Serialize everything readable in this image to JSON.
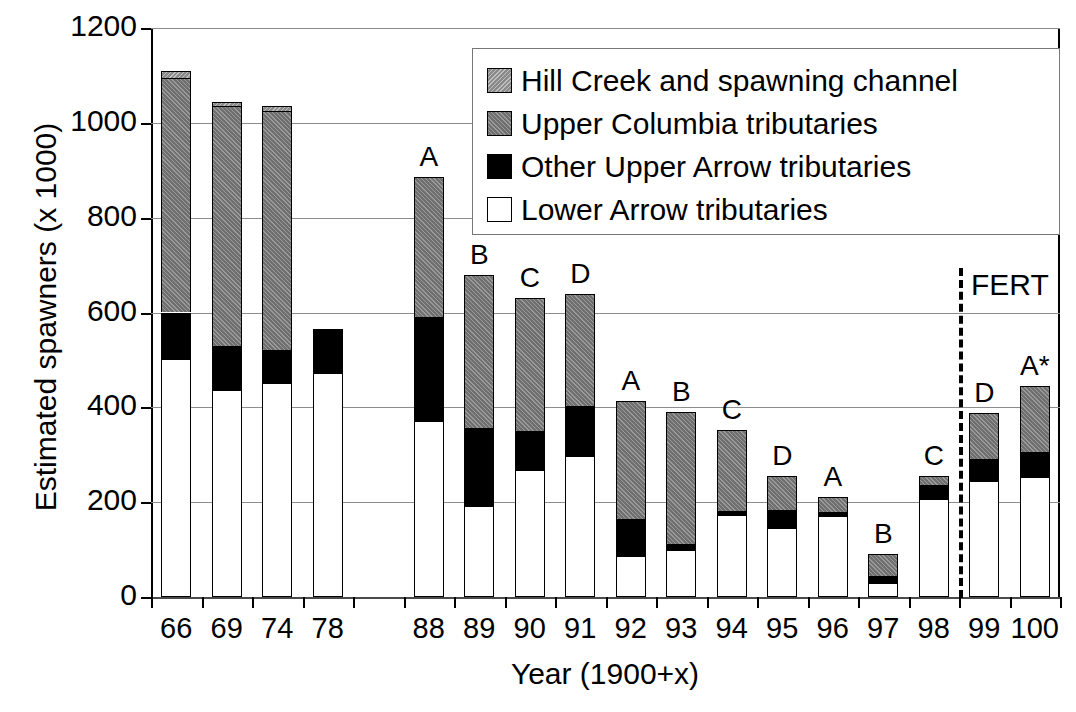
{
  "chart_data": {
    "type": "bar",
    "stacked": true,
    "title": "",
    "xlabel": "Year (1900+x)",
    "ylabel": "Estimated spawners (x 1000)",
    "ylim": [
      0,
      1200
    ],
    "yticks": [
      0,
      200,
      400,
      600,
      800,
      1000,
      1200
    ],
    "grid": true,
    "legend_position": "top-right",
    "categories": [
      "66",
      "69",
      "74",
      "78",
      "",
      "88",
      "89",
      "90",
      "91",
      "92",
      "93",
      "94",
      "95",
      "96",
      "97",
      "98",
      "99",
      "100"
    ],
    "series": [
      {
        "name": "Lower Arrow tributaries",
        "values": [
          500,
          435,
          450,
          470,
          null,
          370,
          190,
          265,
          295,
          85,
          97,
          170,
          143,
          168,
          27,
          205,
          243,
          250
        ]
      },
      {
        "name": "Other Upper Arrow tributaries",
        "values": [
          100,
          95,
          70,
          95,
          null,
          220,
          167,
          85,
          108,
          80,
          15,
          12,
          40,
          12,
          17,
          32,
          48,
          55
        ]
      },
      {
        "name": "Upper Columbia tributaries",
        "values": [
          495,
          505,
          505,
          0,
          null,
          295,
          323,
          280,
          235,
          248,
          278,
          170,
          72,
          30,
          47,
          18,
          97,
          140
        ]
      },
      {
        "name": "Hill Creek and spawning channel",
        "values": [
          15,
          10,
          10,
          0,
          null,
          0,
          0,
          0,
          0,
          0,
          0,
          0,
          0,
          0,
          0,
          0,
          0,
          0
        ]
      }
    ],
    "totals": [
      1110,
      1045,
      1035,
      565,
      null,
      885,
      680,
      630,
      638,
      413,
      390,
      352,
      255,
      210,
      91,
      255,
      388,
      445
    ],
    "bar_annotations": [
      "",
      "",
      "",
      "",
      "",
      "A",
      "B",
      "C",
      "D",
      "A",
      "B",
      "C",
      "D",
      "A",
      "B",
      "C",
      "D",
      "A*"
    ],
    "markers": [
      {
        "name": "FERT",
        "label": "FERT",
        "type": "vertical-dashed-line",
        "between": [
          "98",
          "99"
        ]
      }
    ],
    "colors": {
      "hill": "#8a8a8a",
      "upper": "#6f6f6f",
      "other": "#000000",
      "lower": "#ffffff",
      "grid": "#8d8d8d",
      "axis": "#000000"
    }
  },
  "legend": {
    "items": [
      {
        "label": "Hill Creek and spawning channel",
        "key": "hill"
      },
      {
        "label": "Upper Columbia tributaries",
        "key": "upper"
      },
      {
        "label": "Other Upper Arrow tributaries",
        "key": "other"
      },
      {
        "label": "Lower Arrow tributaries",
        "key": "lower"
      }
    ]
  }
}
